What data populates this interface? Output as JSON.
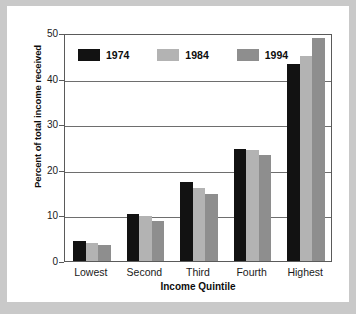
{
  "chart_data": {
    "type": "bar",
    "title": "",
    "subtitle": "",
    "xlabel": "Income Quintile",
    "ylabel": "Percent of total income received",
    "categories": [
      "Lowest",
      "Second",
      "Third",
      "Fourth",
      "Highest"
    ],
    "series": [
      {
        "name": "1974",
        "color": "#121212",
        "values": [
          4.3,
          10.4,
          17.4,
          24.5,
          43.2
        ]
      },
      {
        "name": "1984",
        "color": "#b3b3b3",
        "values": [
          3.9,
          9.9,
          16.1,
          24.4,
          45.0
        ]
      },
      {
        "name": "1994",
        "color": "#8e8e8e",
        "values": [
          3.5,
          8.8,
          14.8,
          23.2,
          48.9
        ]
      }
    ],
    "ylim": [
      0,
      50
    ],
    "yticks": [
      0,
      10,
      20,
      30,
      40,
      50
    ],
    "ytick_labels": [
      "0",
      "10",
      "20",
      "30",
      "40",
      "50"
    ],
    "grid": true,
    "grid_axis": "y",
    "legend_position": "upper-left-inside",
    "annotations": []
  },
  "figure": {
    "background_color": "#c9c9c9",
    "plot_background_color": "#ffffff",
    "axis_color": "#5a5a5a"
  }
}
